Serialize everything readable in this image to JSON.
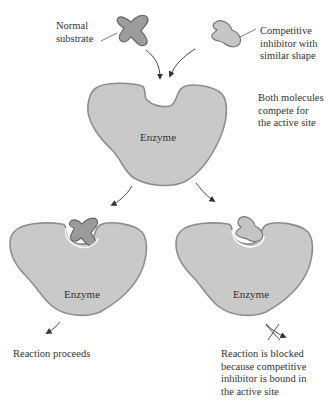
{
  "labels": {
    "normal_substrate": [
      "Normal",
      "substrate"
    ],
    "competitive_inhibitor": [
      "Competitive",
      "inhibitor with",
      "similar shape"
    ],
    "compete_note": [
      "Both molecules",
      "compete for",
      "the active site"
    ],
    "reaction_proceeds": "Reaction proceeds",
    "reaction_blocked": [
      "Reaction is blocked",
      "because competitive",
      "inhibitor is bound in",
      "the active site"
    ]
  },
  "enzymes": {
    "top": "Enzyme",
    "left": "Enzyme",
    "right": "Enzyme"
  },
  "colors": {
    "enzyme_fill": "#c9c9c9",
    "enzyme_stroke": "#8a8a8a",
    "substrate_fill": "#9a9a9a",
    "inhibitor_fill": "#c4c4c4",
    "arrow": "#333333",
    "text": "#333333"
  }
}
